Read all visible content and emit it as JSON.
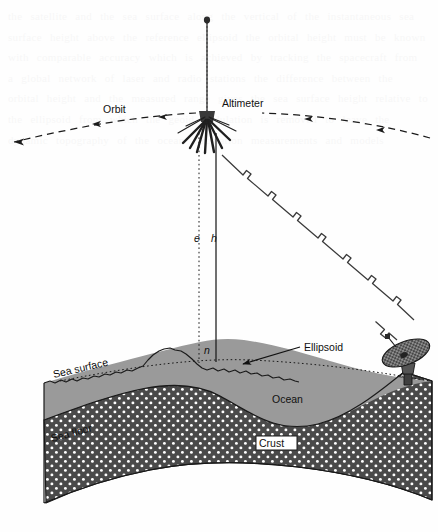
{
  "figure": {
    "domain": "scientific-diagram"
  },
  "labels": {
    "altimeter": "Altimeter",
    "orbit": "Orbit",
    "ellipsoid": "Ellipsoid",
    "sea_surface": "Sea surface",
    "sea_floor": "Sea floor",
    "ocean": "Ocean",
    "crust": "Crust",
    "symbol_e": "e",
    "symbol_h": "h",
    "symbol_n": "n"
  },
  "colors": {
    "page_background": "#fefefe",
    "ocean_fill": "#9a9a9a",
    "crust_fill": "#4a4a4a",
    "crust_dots": "#ffffff",
    "line": "#1a1a1a",
    "text": "#111111",
    "ghost_text": "#777777"
  },
  "elements": {
    "satellite": {
      "name": "altimeter-satellite",
      "mast_top_marker": "dark-dot",
      "body": "radiating-antenna-fan"
    },
    "orbit_track": {
      "style": "dashed-curve",
      "direction": "leftward",
      "arrowhead_count": 5
    },
    "radio_link": {
      "style": "zigzag-lightning-line",
      "from": "satellite",
      "to": "ground-station-dish"
    },
    "ground_station": {
      "name": "ground-station-dish",
      "type": "parabolic-mesh-antenna"
    },
    "verticals": {
      "e_line": "dotted-vertical-ellipsoid-height",
      "h_line": "solid-vertical-satellite-altitude"
    },
    "ellipsoid_line": "horizontal-dotted-reference-surface"
  },
  "ghost_text": "the satellite and the sea surface along the vertical of the instantaneous sea surface height above the reference ellipsoid the orbital height must be known with comparable accuracy which is achieved by tracking the spacecraft from a global network of laser and radio stations the difference between the orbital height and the measured range gives the sea surface height relative to the ellipsoid from which the geoid undulation is removed to leave the dynamic topography of the ocean circulation measurements and models"
}
